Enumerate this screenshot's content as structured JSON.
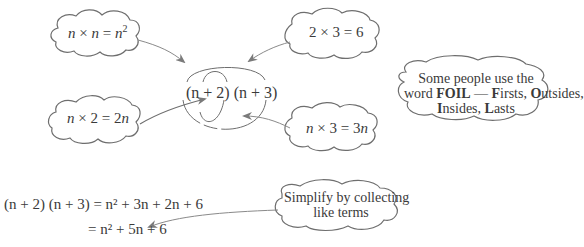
{
  "diagram": {
    "center_expression": "(n + 2) (n + 3)",
    "clouds": [
      {
        "id": "firsts",
        "text": "n × n = n²",
        "parts": {
          "a": "n",
          "op": "×",
          "b": "n",
          "eq": "=",
          "res_base": "n",
          "res_exp": "2"
        }
      },
      {
        "id": "lasts",
        "text": "2 × 3 = 6",
        "parts": {
          "a": "2",
          "op": "×",
          "b": "3",
          "eq": "=",
          "res": "6"
        }
      },
      {
        "id": "outsides",
        "text": "n × 2 = 2n",
        "parts": {
          "a": "n",
          "op": "×",
          "b": "2",
          "eq": "=",
          "res_coef": "2",
          "res_var": "n"
        }
      },
      {
        "id": "insides",
        "text": "n × 3 = 3n",
        "parts": {
          "a": "n",
          "op": "×",
          "b": "3",
          "eq": "=",
          "res_coef": "3",
          "res_var": "n"
        }
      }
    ],
    "foil_note": {
      "line1": "Some people use the",
      "word": "word",
      "foil": "FOIL",
      "dash": "—",
      "F": "F",
      "irsts": "irsts,",
      "O": "O",
      "utsides": "utsides,",
      "I": "I",
      "nsides": "nsides,",
      "L": "L",
      "asts": "asts"
    },
    "simplify_note": {
      "line1": "Simplify by collecting",
      "line2": "like terms"
    },
    "working": {
      "line1": {
        "lhs": "(n + 2) (n + 3)",
        "rhs": "= n² + 3n + 2n + 6"
      },
      "line2": {
        "rhs": "= n² + 5n + 6"
      }
    },
    "colors": {
      "stroke": "#6e6e6e",
      "arrow": "#8a8a8a",
      "text": "#3a3a3a"
    }
  }
}
